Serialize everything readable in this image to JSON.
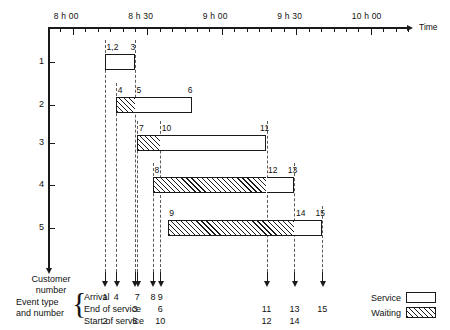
{
  "chart_data": {
    "type": "bar",
    "title": "",
    "xlabel": "Time",
    "ylabel": "Customer number",
    "orientation": "horizontal",
    "grid": false,
    "legend_position": "bottom-right",
    "xlim_hours": [
      7.8333,
      10.25
    ],
    "x_tick_labels": [
      "8 h 00",
      "8 h 30",
      "9 h 00",
      "9 h 30",
      "10 h 00"
    ],
    "x_tick_hours": [
      8.0,
      8.5,
      9.0,
      9.5,
      10.0
    ],
    "x_minor_tick_step_minutes": 5,
    "categories": [
      "1",
      "2",
      "3",
      "4",
      "5"
    ],
    "series": [
      {
        "name": "Waiting",
        "fill": "hatched"
      },
      {
        "name": "Service",
        "fill": "white"
      }
    ],
    "customers": [
      {
        "customer": "1",
        "waiting": null,
        "service": {
          "start_hours": 8.2167,
          "end_hours": 8.4167
        },
        "start_label": "1,2",
        "end_label": "3"
      },
      {
        "customer": "2",
        "waiting": {
          "start_hours": 8.2917,
          "end_hours": 8.4167
        },
        "service": {
          "start_hours": 8.4167,
          "end_hours": 8.8
        },
        "waiting_start_label": "4",
        "service_start_label": "5",
        "end_label": "6"
      },
      {
        "customer": "3",
        "waiting": {
          "start_hours": 8.4333,
          "end_hours": 8.5875
        },
        "service": {
          "start_hours": 8.5875,
          "end_hours": 9.3
        },
        "waiting_start_label": "7",
        "service_start_label": "10",
        "end_label": "11"
      },
      {
        "customer": "4",
        "waiting": {
          "start_hours": 8.5375,
          "end_hours": 9.3
        },
        "service": {
          "start_hours": 9.3,
          "end_hours": 9.4875
        },
        "waiting_start_label": "8",
        "service_start_label": "12",
        "end_label": "13"
      },
      {
        "customer": "5",
        "waiting": {
          "start_hours": 8.6375,
          "end_hours": 9.4875
        },
        "service": {
          "start_hours": 9.4875,
          "end_hours": 9.675
        },
        "waiting_start_label": "9",
        "service_start_label": "14",
        "end_label": "15"
      }
    ],
    "event_columns": [
      {
        "time_hours": 8.2167,
        "arrival": "1",
        "end_of_service": "",
        "start_of_service": "2"
      },
      {
        "time_hours": 8.2917,
        "arrival": "4",
        "end_of_service": "",
        "start_of_service": ""
      },
      {
        "time_hours": 8.4167,
        "arrival": "",
        "end_of_service": "3",
        "start_of_service": "5"
      },
      {
        "time_hours": 8.4333,
        "arrival": "7",
        "end_of_service": "",
        "start_of_service": ""
      },
      {
        "time_hours": 8.5375,
        "arrival": "8",
        "end_of_service": "",
        "start_of_service": ""
      },
      {
        "time_hours": 8.5875,
        "arrival": "9",
        "end_of_service": "6",
        "start_of_service": "10"
      },
      {
        "time_hours": 9.3,
        "arrival": "",
        "end_of_service": "11",
        "start_of_service": "12"
      },
      {
        "time_hours": 9.4875,
        "arrival": "",
        "end_of_service": "13",
        "start_of_service": "14"
      },
      {
        "time_hours": 9.675,
        "arrival": "",
        "end_of_service": "15",
        "start_of_service": ""
      }
    ]
  },
  "axis": {
    "time_axis_label": "Time",
    "customer_axis_label_line1": "Customer",
    "customer_axis_label_line2": "number",
    "y_ticks": [
      "1",
      "2",
      "3",
      "4",
      "5"
    ],
    "x_ticks": [
      "8 h 00",
      "8 h 30",
      "9 h 00",
      "9 h 30",
      "10 h 00"
    ]
  },
  "event_table": {
    "caption_line1": "Event type",
    "caption_line2": "and number",
    "brace": "{",
    "rows": [
      {
        "label": "Arrival",
        "values": [
          "1",
          "4",
          "",
          "7",
          "8",
          "9",
          "",
          "",
          ""
        ]
      },
      {
        "label": "End of service",
        "values": [
          "",
          "",
          "3",
          "",
          "",
          "6",
          "11",
          "13",
          "15"
        ]
      },
      {
        "label": "Start of service",
        "values": [
          "2",
          "",
          "5",
          "",
          "",
          "10",
          "12",
          "14",
          ""
        ]
      }
    ]
  },
  "legend": {
    "items": [
      {
        "label": "Service",
        "pattern": "white"
      },
      {
        "label": "Waiting",
        "pattern": "hatched"
      }
    ]
  },
  "bar_labels": {
    "c1_start": "1,2",
    "c1_end": "3",
    "c2_wait": "4",
    "c2_serv": "5",
    "c2_end": "6",
    "c3_wait": "7",
    "c3_serv": "10",
    "c3_end": "11",
    "c4_wait": "8",
    "c4_serv": "12",
    "c4_end": "13",
    "c5_wait": "9",
    "c5_serv": "14",
    "c5_end": "15"
  },
  "colors": {
    "ink": "#1a1a1a",
    "dash": "#5a5a5a",
    "paper": "#ffffff"
  }
}
